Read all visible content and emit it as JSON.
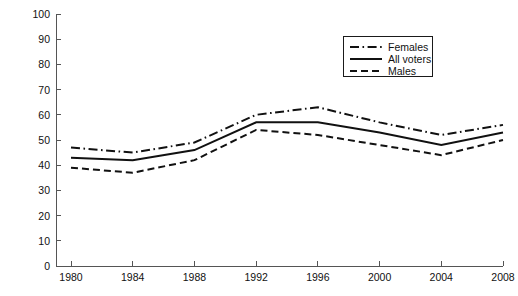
{
  "chart_data": {
    "type": "line",
    "title": "",
    "xlabel": "",
    "ylabel": "Percent Voting Democratic",
    "categories": [
      "1980",
      "1984",
      "1988",
      "1992",
      "1996",
      "2000",
      "2004",
      "2008"
    ],
    "x": [
      1980,
      1984,
      1988,
      1992,
      1996,
      2000,
      2004,
      2008
    ],
    "xlim": [
      1978,
      2010
    ],
    "ylim": [
      0,
      100
    ],
    "ytick_labels": [
      "0",
      "10",
      "20",
      "30",
      "40",
      "50",
      "60",
      "70",
      "80",
      "90",
      "100"
    ],
    "yticks": [
      0,
      10,
      20,
      30,
      40,
      50,
      60,
      70,
      80,
      90,
      100
    ],
    "grid": false,
    "legend_position": "upper right",
    "series": [
      {
        "name": "Females",
        "style": "dash-dot",
        "color": "#111111",
        "values": [
          47,
          45,
          49,
          60,
          63,
          57,
          52,
          56
        ]
      },
      {
        "name": "All voters",
        "style": "solid",
        "color": "#111111",
        "values": [
          43,
          42,
          46,
          57,
          57,
          53,
          48,
          53
        ]
      },
      {
        "name": "Males",
        "style": "dashed",
        "color": "#111111",
        "values": [
          39,
          37,
          42,
          54,
          52,
          48,
          44,
          50
        ]
      }
    ]
  },
  "axes": {
    "y_axis_label": "Percent Voting Democratic"
  },
  "legend": {
    "entries": [
      {
        "label": "Females",
        "style": "dash-dot"
      },
      {
        "label": "All voters",
        "style": "solid"
      },
      {
        "label": "Males",
        "style": "dashed"
      }
    ]
  },
  "colors": {
    "line": "#111111",
    "axis": "#555555",
    "background": "#ffffff"
  }
}
